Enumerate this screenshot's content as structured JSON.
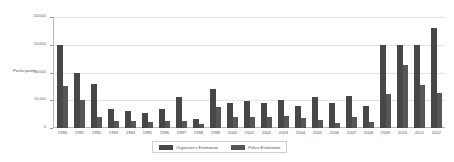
{
  "chart_data": {
    "type": "bar",
    "title": "",
    "xlabel": "",
    "ylabel": "Participants",
    "ylim": [
      0,
      200000
    ],
    "yticks": [
      0,
      50000,
      100000,
      150000,
      200000
    ],
    "ytick_labels": [
      "0",
      "50,000",
      "100000",
      "150000",
      "200000"
    ],
    "grid": true,
    "legend_position": "bottom",
    "categories": [
      "1990",
      "1991",
      "1992",
      "1993",
      "1994",
      "1995",
      "1996",
      "1997",
      "1998",
      "1999",
      "2000",
      "2001",
      "2002",
      "2003",
      "2004",
      "2005",
      "2006",
      "2007",
      "2008",
      "2009",
      "2010",
      "2011",
      "2012"
    ],
    "series": [
      {
        "name": "Organiser's Estimation",
        "color": "#474747",
        "values": [
          150000,
          100000,
          80000,
          35000,
          30000,
          27000,
          35000,
          55000,
          16000,
          70000,
          45000,
          48000,
          45000,
          50000,
          40000,
          55000,
          45000,
          58000,
          40000,
          150000,
          150000,
          150000,
          180000
        ]
      },
      {
        "name": "Police Estimation",
        "color": "#565656",
        "values": [
          75000,
          50000,
          20000,
          12000,
          13000,
          10000,
          12000,
          13000,
          7000,
          38000,
          20000,
          20000,
          20000,
          22000,
          18000,
          15000,
          9000,
          20000,
          10000,
          62000,
          113000,
          77000,
          63000
        ]
      }
    ]
  }
}
